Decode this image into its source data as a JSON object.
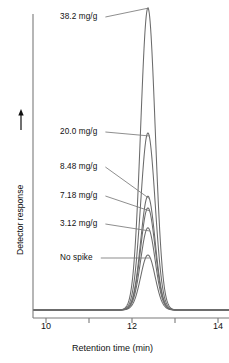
{
  "chart_data": {
    "type": "line",
    "title": "",
    "xlabel": "Retention time (min)",
    "ylabel": "Detector response",
    "xlim": [
      9.7,
      14.2
    ],
    "ylim": [
      0,
      1.0
    ],
    "grid": false,
    "legend_position": "inline-annotations",
    "x_ticks_major": [
      "10",
      "12",
      "14"
    ],
    "x_ticks_minor": [
      "11",
      "13"
    ],
    "y_axis_arrow": true,
    "y_axis_ticks": [],
    "peak_center_min": 12.37,
    "peak_width_min": 0.3,
    "series": [
      {
        "name": "38.2 mg/g",
        "label": "38.2 mg/g",
        "amplitude": 1.0,
        "apex_y_px": 8
      },
      {
        "name": "20.0 mg/g",
        "label": "20.0 mg/g",
        "amplitude": 0.586,
        "apex_y_px": 133
      },
      {
        "name": "8.48 mg/g",
        "label": "8.48 mg/g",
        "amplitude": 0.377,
        "apex_y_px": 196
      },
      {
        "name": "7.18 mg/g",
        "label": "7.18 mg/g",
        "amplitude": 0.338,
        "apex_y_px": 208
      },
      {
        "name": "3.12 mg/g",
        "label": "3.12 mg/g",
        "amplitude": 0.272,
        "apex_y_px": 228
      },
      {
        "name": "No spike",
        "label": "No spike",
        "amplitude": 0.182,
        "apex_y_px": 255
      }
    ],
    "annotations": [
      {
        "text": "38.2 mg/g",
        "x_px": 60,
        "y_px": 13
      },
      {
        "text": "20.0 mg/g",
        "x_px": 60,
        "y_px": 128
      },
      {
        "text": "8.48 mg/g",
        "x_px": 60,
        "y_px": 163
      },
      {
        "text": "7.18 mg/g",
        "x_px": 60,
        "y_px": 192
      },
      {
        "text": "3.12 mg/g",
        "x_px": 60,
        "y_px": 220
      },
      {
        "text": "No spike",
        "x_px": 60,
        "y_px": 254
      }
    ],
    "colors": {
      "trace": "#6b6b6b",
      "axis": "#7a7a7a",
      "text": "#111111",
      "background": "#ffffff"
    }
  },
  "axis": {
    "x_tick_labels": [
      {
        "text": "10",
        "x_px": 46
      },
      {
        "text": "12",
        "x_px": 132
      },
      {
        "text": "14",
        "x_px": 218
      }
    ],
    "xlabel": "Retention time (min)",
    "ylabel": "Detector response"
  }
}
